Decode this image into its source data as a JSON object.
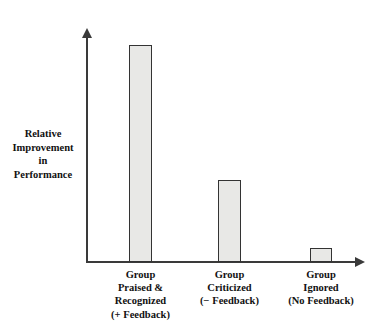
{
  "chart_data": {
    "type": "bar",
    "title": "",
    "subtitle": "",
    "xlabel": "",
    "ylabel": "Relative Improvement in Performance",
    "categories": [
      "Group Praised & Recognized (+ Feedback)",
      "Group Criticized (− Feedback)",
      "Group Ignored (No Feedback)"
    ],
    "values": [
      100,
      38,
      6.5
    ],
    "ylim": [
      0,
      108
    ],
    "grid": false,
    "legend": false,
    "axis_arrows": true,
    "tick_labels": []
  },
  "y_axis": {
    "caption_lines": [
      "Relative",
      "Improvement",
      "in",
      "Performance"
    ]
  },
  "x_axis": {
    "categories": [
      {
        "lines": [
          "Group",
          "Praised &",
          "Recognized",
          "(+ Feedback)"
        ],
        "value": 100
      },
      {
        "lines": [
          "Group",
          "Criticized",
          "(− Feedback)"
        ],
        "value": 38
      },
      {
        "lines": [
          "Group",
          "Ignored",
          "(No Feedback)"
        ],
        "value": 6.5
      }
    ]
  },
  "style": {
    "bar_fill": "#e8e8e6",
    "bar_stroke": "#333333",
    "axis_color": "#3a3a3a",
    "text_color": "#111111",
    "background": "#ffffff"
  }
}
